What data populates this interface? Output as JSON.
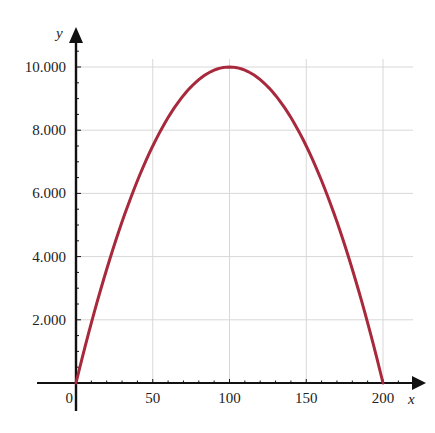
{
  "chart_data": {
    "type": "line",
    "title": "",
    "xlabel": "x",
    "ylabel": "y",
    "function": "y = 200x - x^2",
    "xlim": [
      0,
      200
    ],
    "ylim": [
      0,
      10000
    ],
    "x_ticks": [
      0,
      50,
      100,
      150,
      200
    ],
    "x_tick_labels": [
      "0",
      "50",
      "100",
      "150",
      "200"
    ],
    "y_ticks": [
      2000,
      4000,
      6000,
      8000,
      10000
    ],
    "y_tick_labels": [
      "2.000",
      "4.000",
      "6.000",
      "8.000",
      "10.000"
    ],
    "x_minor_step": 10,
    "y_minor_step": 500,
    "grid": true,
    "series": [
      {
        "name": "curve",
        "color": "#a8283c",
        "x": [
          0,
          10,
          20,
          30,
          40,
          50,
          60,
          70,
          80,
          90,
          100,
          110,
          120,
          130,
          140,
          150,
          160,
          170,
          180,
          190,
          200
        ],
        "values": [
          0,
          1900,
          3600,
          5100,
          6400,
          7500,
          8400,
          9100,
          9600,
          9900,
          10000,
          9900,
          9600,
          9100,
          8400,
          7500,
          6400,
          5100,
          3600,
          1900,
          0
        ]
      }
    ]
  },
  "colors": {
    "curve": "#a8283c",
    "axis": "#111111",
    "grid": "#d8d8d8"
  }
}
